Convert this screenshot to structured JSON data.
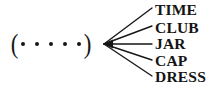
{
  "figure": {
    "type": "fan-out-diagram",
    "background_color": "#ffffff",
    "ink_color": "#161616"
  },
  "source": {
    "open_paren": "(",
    "close_paren": ")",
    "dot_glyph": "•",
    "dot_count": 5,
    "dots": [
      "•",
      "•",
      "•",
      "•",
      "•"
    ]
  },
  "arrow": {
    "head_direction": "left",
    "tip_x": 104,
    "tip_y": 44,
    "branch_count": 5
  },
  "branches": [
    {
      "label": "TIME",
      "end_x": 152,
      "end_y": 8
    },
    {
      "label": "CLUB",
      "end_x": 152,
      "end_y": 26
    },
    {
      "label": "JAR",
      "end_x": 152,
      "end_y": 44
    },
    {
      "label": "CAP",
      "end_x": 152,
      "end_y": 60
    },
    {
      "label": "DRESS",
      "end_x": 152,
      "end_y": 76
    }
  ]
}
